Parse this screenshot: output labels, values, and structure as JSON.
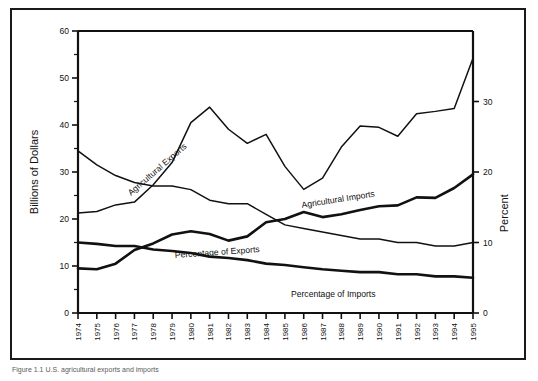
{
  "figure": {
    "caption": "Figure 1.1 U.S. agricultural exports and imports",
    "background_color": "#ffffff",
    "line_color": "#111111",
    "frame_color": "#1a1a1a"
  },
  "chart_data": {
    "type": "line",
    "title": "",
    "xlabel": "",
    "ylabel": "Billions of Dollars",
    "y2label": "Percent",
    "ylim": [
      0,
      60
    ],
    "y2lim": [
      0,
      40
    ],
    "xlim": [
      1974,
      1995
    ],
    "grid": false,
    "legend": "inline-labels",
    "yticks": [
      0,
      10,
      20,
      30,
      40,
      50,
      60
    ],
    "yticklabels": [
      "0",
      "10",
      "20",
      "30",
      "40",
      "50",
      "60"
    ],
    "yminorticks": [
      5,
      15,
      25,
      35,
      45,
      55
    ],
    "y2ticks": [
      0,
      10,
      20,
      30
    ],
    "y2ticklabels": [
      "0",
      "10",
      "20",
      "30"
    ],
    "categories": [
      1974,
      1975,
      1976,
      1977,
      1978,
      1979,
      1980,
      1981,
      1982,
      1983,
      1984,
      1985,
      1986,
      1987,
      1988,
      1989,
      1990,
      1991,
      1992,
      1993,
      1994,
      1995
    ],
    "xticklabels": [
      "1974",
      "1975",
      "1976",
      "1977",
      "1978",
      "1979",
      "1980",
      "1981",
      "1982",
      "1983",
      "1984",
      "1985",
      "1986",
      "1987",
      "1988",
      "1989",
      "1990",
      "1991",
      "1992",
      "1993",
      "1994",
      "1995"
    ],
    "series": [
      {
        "name": "Agricultural Exports",
        "label": "Agricultural  Exports",
        "axis": "left",
        "units": "Billions of Dollars",
        "stroke_width": 1.5,
        "values": [
          21.3,
          21.6,
          23.0,
          23.6,
          27.3,
          32.0,
          40.5,
          43.8,
          39.1,
          36.1,
          38.0,
          31.2,
          26.3,
          28.7,
          35.3,
          39.8,
          39.5,
          37.6,
          42.4,
          42.9,
          43.5,
          54.2
        ]
      },
      {
        "name": "Agricultural Imports",
        "label": "Agricultural  Imports",
        "axis": "left",
        "units": "Billions of Dollars",
        "stroke_width": 2.6,
        "values": [
          9.5,
          9.3,
          10.5,
          13.4,
          14.8,
          16.7,
          17.4,
          16.8,
          15.4,
          16.3,
          19.3,
          20.0,
          21.5,
          20.4,
          21.0,
          21.9,
          22.7,
          22.9,
          24.6,
          24.5,
          26.6,
          29.5
        ]
      },
      {
        "name": "Percentage of Exports",
        "label": "Percentage of Exports",
        "axis": "right",
        "units": "Percent",
        "stroke_width": 1.5,
        "values": [
          23.0,
          21.0,
          19.5,
          18.5,
          18.0,
          18.0,
          17.5,
          16.0,
          15.5,
          15.5,
          14.0,
          12.5,
          12.0,
          11.5,
          11.0,
          10.5,
          10.5,
          10.0,
          10.0,
          9.5,
          9.5,
          10.0
        ]
      },
      {
        "name": "Percentage of Imports",
        "label": "Percentage of Imports",
        "axis": "right",
        "units": "Percent",
        "stroke_width": 2.6,
        "values": [
          10.0,
          9.8,
          9.5,
          9.5,
          9.0,
          8.8,
          8.5,
          8.0,
          7.8,
          7.5,
          7.0,
          6.8,
          6.5,
          6.2,
          6.0,
          5.8,
          5.8,
          5.5,
          5.5,
          5.2,
          5.2,
          5.0
        ]
      }
    ]
  }
}
